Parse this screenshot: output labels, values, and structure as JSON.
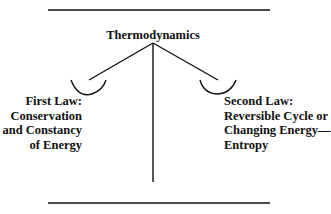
{
  "diagram": {
    "title": "Thermodynamics",
    "left_branch": {
      "lines": [
        "First Law:",
        "Conservation",
        "and Constancy",
        "of Energy"
      ]
    },
    "right_branch": {
      "lines": [
        "Second Law:",
        "Reversible Cycle or",
        "Changing Energy—",
        "Entropy"
      ]
    },
    "colors": {
      "ink": "#111111",
      "background": "#ffffff"
    }
  }
}
